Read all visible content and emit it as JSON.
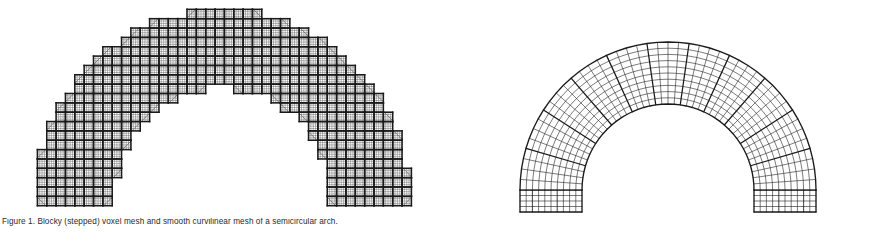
{
  "figure": {
    "background": "#ffffff",
    "stroke_color": "#1a1a1a",
    "caption_prefix": "Figure 1",
    "caption_text": "Figure 1. Blocky (stepped) voxel mesh and smooth curvilinear mesh of a semicircular arch.",
    "panels": [
      {
        "id": "blocky-arch",
        "name": "Stepped / voxelised arch mesh",
        "mesh_type": "blocky",
        "note": "Cartesian voxel approximation; macro blocks aligned to a square background grid, producing a staircase boundary."
      },
      {
        "id": "smooth-arch",
        "name": "Smooth curvilinear arch mesh",
        "mesh_type": "curvilinear",
        "note": "Body fitted polar mesh; elements follow the circular intrados and extrados exactly."
      }
    ]
  },
  "chart_data": {
    "type": "diagram",
    "panel_count": 2,
    "geometry": {
      "shape": "semicircular arch",
      "inner_radius_units": 58,
      "outer_radius_units": 100,
      "span_angle_degrees": 180,
      "leg_height_units": 22
    },
    "left_panel": {
      "label": "blocky mesh",
      "cell_size_px": 9.2,
      "radial_macro_blocks": 10,
      "circumferential_macro_blocks": 22,
      "sub_cells_per_block": 4,
      "boundary": "staircase"
    },
    "right_panel": {
      "label": "smooth mesh",
      "radial_divisions": 10,
      "circumferential_divisions": 44,
      "leg_rows": 4,
      "boundary": "conforming circular arcs"
    }
  }
}
